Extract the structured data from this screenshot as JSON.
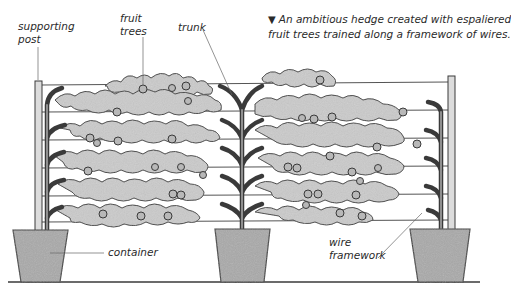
{
  "caption": {
    "marker": "▼",
    "line1": "An ambitious hedge created with espaliered",
    "line2": "fruit trees trained along a framework of wires."
  },
  "labels": {
    "supporting_post": [
      "supporting",
      "post"
    ],
    "fruit_trees": [
      "fruit",
      "trees"
    ],
    "trunk": "trunk",
    "container": "container",
    "wire_framework": [
      "wire",
      "framework"
    ]
  },
  "colors": {
    "ink": "#3a3a3a",
    "foliage": "#c9c9c9",
    "pot": "#a9a9a9",
    "post": "#d8d8d8",
    "background": "#ffffff"
  }
}
